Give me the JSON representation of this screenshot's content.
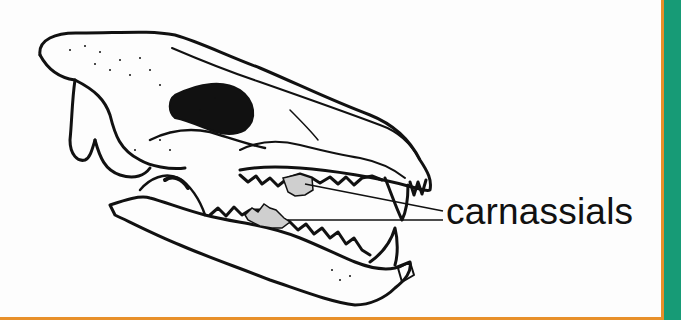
{
  "figure": {
    "label": "carnassials",
    "highlighted_teeth": [
      "upper carnassial",
      "lower carnassial"
    ]
  },
  "colors": {
    "frame_orange": "#e8902a",
    "frame_green": "#179b76",
    "ink": "#111111",
    "highlight_fill": "#cfcfcf",
    "background": "#fdfdfd"
  }
}
